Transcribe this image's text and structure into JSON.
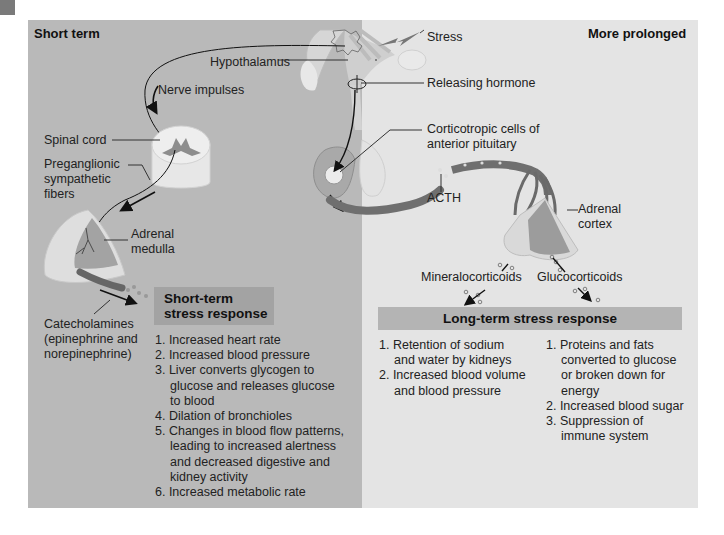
{
  "panels": {
    "left_heading": "Short term",
    "right_heading": "More prolonged"
  },
  "labels": {
    "stress": "Stress",
    "hypothalamus": "Hypothalamus",
    "releasing_hormone": "Releasing hormone",
    "nerve_impulses": "Nerve impulses",
    "spinal_cord": "Spinal cord",
    "preganglionic_1": "Preganglionic",
    "preganglionic_2": "sympathetic",
    "preganglionic_3": "fibers",
    "corticotropic_1": "Corticotropic cells of",
    "corticotropic_2": "anterior pituitary",
    "acth": "ACTH",
    "adrenal_medulla_1": "Adrenal",
    "adrenal_medulla_2": "medulla",
    "adrenal_cortex_1": "Adrenal",
    "adrenal_cortex_2": "cortex",
    "mineralocorticoids": "Mineralocorticoids",
    "glucocorticoids": "Glucocorticoids",
    "catecholamines_1": "Catecholamines",
    "catecholamines_2": "(epinephrine and",
    "catecholamines_3": "norepinephrine)"
  },
  "short_term_response": {
    "title_line1": "Short-term",
    "title_line2": "stress response",
    "items": [
      "1. Increased heart rate",
      "2. Increased blood pressure",
      "3. Liver converts glycogen to\nglucose and releases glucose\nto blood",
      "4. Dilation of bronchioles",
      "5. Changes in blood flow patterns,\nleading to increased alertness\nand decreased digestive and\nkidney activity",
      "6. Increased metabolic rate"
    ]
  },
  "long_term_response": {
    "title": "Long-term stress response",
    "mineralocorticoid_effects": [
      "1. Retention of sodium\nand water by kidneys",
      "2. Increased blood volume\nand blood pressure"
    ],
    "glucocorticoid_effects": [
      "1. Proteins and fats\nconverted to glucose\nor broken down for\nenergy",
      "2. Increased blood sugar",
      "3. Suppression of\nimmune system"
    ]
  },
  "colors": {
    "short_term_panel": "#b9b9b9",
    "prolonged_panel": "#e4e4e4",
    "short_box": "#a3a3a3",
    "long_box": "#b4b4b4"
  }
}
